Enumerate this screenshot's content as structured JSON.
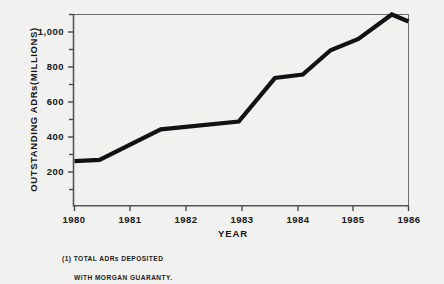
{
  "chart_data": {
    "type": "line",
    "title": "",
    "xlabel": "YEAR",
    "ylabel": "OUTSTANDING ADRs(MILLIONS)",
    "xlim": [
      1980,
      1986
    ],
    "ylim": [
      0,
      1100
    ],
    "grid": false,
    "legend": "none",
    "x_ticks": [
      "1980",
      "1981",
      "1982",
      "1983",
      "1984",
      "1985",
      "1986"
    ],
    "y_ticks": [
      "200",
      "400",
      "600",
      "800",
      "1,000"
    ],
    "y_tick_values": [
      200,
      400,
      600,
      800,
      1000
    ],
    "y_minor_ticks": [
      100,
      300,
      500,
      700,
      900,
      1100
    ],
    "series": [
      {
        "name": "Outstanding ADRs",
        "x": [
          1980.0,
          1980.45,
          1981.55,
          1982.95,
          1983.6,
          1984.1,
          1984.6,
          1985.1,
          1985.7,
          1986.0
        ],
        "values": [
          258,
          265,
          440,
          485,
          735,
          755,
          895,
          960,
          1100,
          1060
        ]
      }
    ],
    "annotations": {
      "footnote_line_1": "(1) TOTAL ADRs DEPOSITED",
      "footnote_line_2": "WITH  MORGAN GUARANTY."
    },
    "colors": {
      "background": "#f1f1ef",
      "line": "#121212",
      "axis": "#4a4a4a",
      "text": "#161616"
    }
  }
}
